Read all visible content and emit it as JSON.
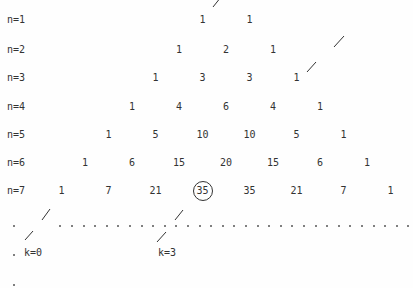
{
  "rows": [
    {
      "label": "n=1",
      "y": 20,
      "values": [
        "1",
        "1"
      ]
    },
    {
      "label": "n=2",
      "y": 50,
      "values": [
        "1",
        "2",
        "1"
      ]
    },
    {
      "label": "n=3",
      "y": 78,
      "values": [
        "1",
        "3",
        "3",
        "1"
      ]
    },
    {
      "label": "n=4",
      "y": 107,
      "values": [
        "1",
        "4",
        "6",
        "4",
        "1"
      ]
    },
    {
      "label": "n=5",
      "y": 135,
      "values": [
        "1",
        "5",
        "10",
        "10",
        "5",
        "1"
      ]
    },
    {
      "label": "n=6",
      "y": 163,
      "values": [
        "1",
        "6",
        "15",
        "20",
        "15",
        "6",
        "1"
      ]
    },
    {
      "label": "n=7",
      "y": 191,
      "values": [
        "1",
        "7",
        "21",
        "35",
        "35",
        "21",
        "7",
        "1"
      ]
    }
  ],
  "highlighted": {
    "row": "n=7",
    "value": "35",
    "index": 3
  },
  "diagonal_labels": [
    {
      "text": "k=0",
      "x": 24,
      "y": 253
    },
    {
      "text": "k=3",
      "x": 158,
      "y": 253
    }
  ],
  "continuation": "dotted"
}
